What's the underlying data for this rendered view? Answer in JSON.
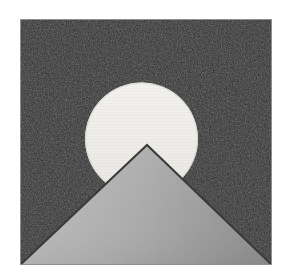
{
  "artwork": {
    "title": "Mountain and Sun",
    "description": "Square dark panel containing a pale circular sun partially occluded by a gray triangular mountain",
    "canvas": {
      "width": 288,
      "height": 275,
      "background_color": "#ffffff"
    },
    "panel": {
      "name": "dark-square-panel",
      "x": 20,
      "y": 19,
      "width": 252,
      "height": 246,
      "fill_color": "#1f1f1f",
      "fill_color_variant": "#272727",
      "border_color": "#8e8e8e",
      "border_width": 1,
      "texture": "noise"
    },
    "circle": {
      "name": "sun-circle",
      "center_x": 141.5,
      "center_y": 139,
      "radius": 56.5,
      "fill_color_top": "#f2f1ee",
      "fill_color_bottom": "#e2e1dc",
      "outline_color": "#cfcec9",
      "texture": "horizontal-striping"
    },
    "triangle": {
      "name": "mountain-triangle",
      "apex_x": 147,
      "apex_y": 145,
      "base_left_x": 20,
      "base_left_y": 265,
      "base_right_x": 272,
      "base_right_y": 265,
      "fill_color_left": "#b6b6b6",
      "fill_color_mid": "#a6a6a6",
      "fill_color_right": "#8b8b8b",
      "outline_color": "#3a3a3a",
      "outline_width": 2
    }
  },
  "chart_data": {
    "type": "scatter",
    "title": "Mountain and Sun",
    "xlabel": "",
    "ylabel": "",
    "xlim": [
      0,
      288
    ],
    "ylim": [
      0,
      275
    ],
    "grid": false,
    "legend": "none",
    "shapes": [
      {
        "name": "dark-square-panel",
        "kind": "rectangle",
        "points": [
          [
            20,
            19
          ],
          [
            272,
            19
          ],
          [
            272,
            265
          ],
          [
            20,
            265
          ]
        ],
        "fill": "#1f1f1f",
        "stroke": "#8e8e8e"
      },
      {
        "name": "sun-circle",
        "kind": "circle",
        "center": [
          141.5,
          139
        ],
        "radius": 56.5,
        "fill": "#ecebe7",
        "stroke": "#cfcec9"
      },
      {
        "name": "mountain-triangle",
        "kind": "triangle",
        "points": [
          [
            147,
            145
          ],
          [
            272,
            265
          ],
          [
            20,
            265
          ]
        ],
        "fill": "#a6a6a6",
        "stroke": "#3a3a3a"
      }
    ]
  }
}
